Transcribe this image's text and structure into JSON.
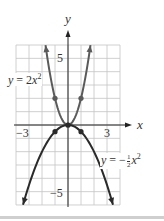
{
  "chart_data": {
    "type": "line",
    "title": "",
    "xlabel": "x",
    "ylabel": "y",
    "xlim": [
      -4,
      4
    ],
    "ylim": [
      -6,
      6
    ],
    "grid": true,
    "x_tick_labels": [
      {
        "value": -3,
        "label": "−3"
      },
      {
        "value": 3,
        "label": "3"
      }
    ],
    "y_tick_labels": [
      {
        "value": 5,
        "label": "5"
      },
      {
        "value": -5,
        "label": "−5"
      }
    ],
    "series": [
      {
        "name": "y = 2x²",
        "function": "2*x^2",
        "color": "#5a5a5a",
        "x_range": [
          -1.73,
          1.73
        ],
        "marked_points": [
          [
            -1,
            2
          ],
          [
            0,
            0
          ],
          [
            1,
            2
          ]
        ],
        "x": [
          -1.73,
          -1.5,
          -1,
          -0.5,
          0,
          0.5,
          1,
          1.5,
          1.73
        ],
        "y": [
          6,
          4.5,
          2,
          0.5,
          0,
          0.5,
          2,
          4.5,
          6
        ]
      },
      {
        "name": "y = −½x²",
        "function": "-0.5*x^2",
        "color": "#2a2a2a",
        "x_range": [
          -3.46,
          3.46
        ],
        "marked_points": [
          [
            -1,
            -0.5
          ],
          [
            0,
            0
          ],
          [
            1,
            -0.5
          ]
        ],
        "x": [
          -3.46,
          -3,
          -2,
          -1,
          0,
          1,
          2,
          3,
          3.46
        ],
        "y": [
          -6,
          -4.5,
          -2,
          -0.5,
          0,
          -0.5,
          -2,
          -4.5,
          -6
        ]
      }
    ],
    "annotations": [
      {
        "text": "y = 2x²",
        "near": [
          -3.5,
          3.5
        ]
      },
      {
        "text": "y = −½x²",
        "near": [
          3.5,
          -2.7
        ]
      }
    ]
  },
  "labels": {
    "x_axis": "x",
    "y_axis": "y",
    "tick_neg3": "−3",
    "tick_3": "3",
    "tick_5": "5",
    "tick_neg5": "−5",
    "eq1_prefix": "y",
    "eq1_mid": " = 2",
    "eq1_var": "x",
    "eq1_exp": "2",
    "eq2_prefix": "y",
    "eq2_mid": " = −",
    "eq2_num": "1",
    "eq2_den": "2",
    "eq2_var": "x",
    "eq2_exp": "2"
  }
}
